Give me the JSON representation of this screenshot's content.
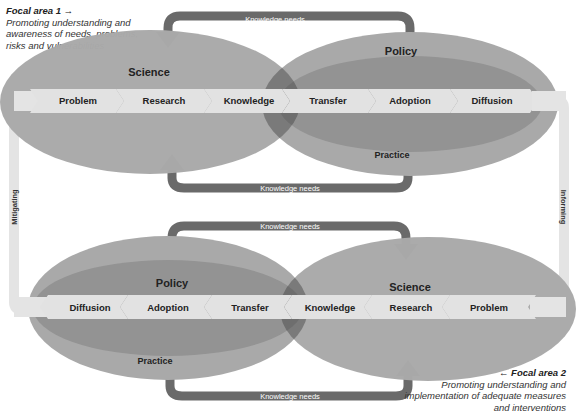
{
  "focal_area_1": {
    "title": "Focal area 1 →",
    "description": "Promoting understanding and awareness of needs, problems, risks and vulnerabilities"
  },
  "focal_area_2": {
    "title": "← Focal area 2",
    "description": "Promoting understanding and implementation of adequate measures and interventions"
  },
  "top_cycle": {
    "left_domain": "Science",
    "right_domain": "Policy",
    "right_subdomain": "Practice",
    "steps": [
      "Problem",
      "Research",
      "Knowledge",
      "Transfer",
      "Adoption",
      "Diffusion"
    ],
    "feedback_top": "Knowledge needs",
    "feedback_bottom": "Knowledge needs"
  },
  "bottom_cycle": {
    "left_domain": "Policy",
    "left_subdomain": "Practice",
    "right_domain": "Science",
    "steps": [
      "Diffusion",
      "Adoption",
      "Transfer",
      "Knowledge",
      "Research",
      "Problem"
    ],
    "feedback_top": "Knowledge needs",
    "feedback_bottom": "Knowledge needs"
  },
  "connectors": {
    "left": "Mitigating",
    "right": "Informing"
  },
  "colors": {
    "outer_ellipse": "#a9a9a9",
    "inner_ellipse": "#939393",
    "overlap": "#6e6e6e",
    "chevron": "#e2e2e2",
    "arrow": "#6a6a6a",
    "connector": "#e4e4e4"
  }
}
